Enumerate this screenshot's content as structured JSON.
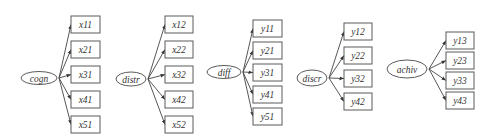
{
  "diagram": {
    "type": "measurement-model",
    "ink_color": "#5a5a5a",
    "factors": [
      {
        "name": "cogn",
        "cx": 39,
        "cy": 78,
        "rx": 18,
        "ry": 6.5,
        "indicators": [
          {
            "name": "x11",
            "x": 71,
            "y": 16,
            "w": 29,
            "h": 17
          },
          {
            "name": "x21",
            "x": 71,
            "y": 41,
            "w": 29,
            "h": 17
          },
          {
            "name": "x31",
            "x": 71,
            "y": 66,
            "w": 29,
            "h": 17
          },
          {
            "name": "x41",
            "x": 71,
            "y": 91,
            "w": 29,
            "h": 17
          },
          {
            "name": "x51",
            "x": 71,
            "y": 116,
            "w": 29,
            "h": 17
          }
        ]
      },
      {
        "name": "distr",
        "cx": 131,
        "cy": 79,
        "rx": 15,
        "ry": 7,
        "indicators": [
          {
            "name": "x12",
            "x": 165,
            "y": 16,
            "w": 28,
            "h": 17
          },
          {
            "name": "x22",
            "x": 165,
            "y": 41,
            "w": 28,
            "h": 17
          },
          {
            "name": "x32",
            "x": 165,
            "y": 66,
            "w": 28,
            "h": 17
          },
          {
            "name": "x42",
            "x": 165,
            "y": 91,
            "w": 28,
            "h": 17
          },
          {
            "name": "x52",
            "x": 165,
            "y": 116,
            "w": 28,
            "h": 17
          }
        ]
      },
      {
        "name": "diff",
        "cx": 224,
        "cy": 72,
        "rx": 17,
        "ry": 6.5,
        "indicators": [
          {
            "name": "y11",
            "x": 253,
            "y": 20,
            "w": 29,
            "h": 17
          },
          {
            "name": "y21",
            "x": 253,
            "y": 42,
            "w": 29,
            "h": 17
          },
          {
            "name": "y31",
            "x": 253,
            "y": 64,
            "w": 29,
            "h": 17
          },
          {
            "name": "y41",
            "x": 253,
            "y": 86,
            "w": 29,
            "h": 17
          },
          {
            "name": "y51",
            "x": 253,
            "y": 108,
            "w": 29,
            "h": 17
          }
        ]
      },
      {
        "name": "discr",
        "cx": 312,
        "cy": 78,
        "rx": 15,
        "ry": 8,
        "indicators": [
          {
            "name": "y12",
            "x": 344,
            "y": 23,
            "w": 28,
            "h": 17
          },
          {
            "name": "y22",
            "x": 344,
            "y": 47,
            "w": 28,
            "h": 17
          },
          {
            "name": "y32",
            "x": 344,
            "y": 70,
            "w": 28,
            "h": 17
          },
          {
            "name": "y42",
            "x": 344,
            "y": 93,
            "w": 28,
            "h": 17
          }
        ]
      },
      {
        "name": "achiv",
        "cx": 407,
        "cy": 69,
        "rx": 20,
        "ry": 9,
        "indicators": [
          {
            "name": "y13",
            "x": 446,
            "y": 32,
            "w": 28,
            "h": 17
          },
          {
            "name": "y23",
            "x": 446,
            "y": 52,
            "w": 28,
            "h": 17
          },
          {
            "name": "y33",
            "x": 446,
            "y": 72,
            "w": 28,
            "h": 17
          },
          {
            "name": "y43",
            "x": 446,
            "y": 92,
            "w": 28,
            "h": 17
          }
        ]
      }
    ]
  }
}
